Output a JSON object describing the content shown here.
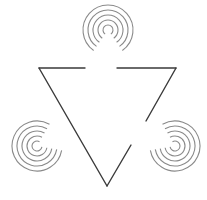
{
  "diagram": {
    "type": "illusory-contour-triangle",
    "background": "#ffffff",
    "line_color": "#3a3a3a",
    "arc_color": "#8a8a8a",
    "triangle": {
      "vertices": [
        [
          39,
          68
        ],
        [
          176,
          68
        ],
        [
          107,
          186
        ]
      ],
      "segments": [
        {
          "x1": 39,
          "y1": 68,
          "x2": 85,
          "y2": 68
        },
        {
          "x1": 117,
          "y1": 68,
          "x2": 176,
          "y2": 68
        },
        {
          "x1": 176,
          "y1": 68,
          "x2": 146,
          "y2": 121
        },
        {
          "x1": 131,
          "y1": 145,
          "x2": 107,
          "y2": 186
        },
        {
          "x1": 107,
          "y1": 186,
          "x2": 39,
          "y2": 68
        }
      ]
    },
    "spirals": [
      {
        "name": "top",
        "cx": 108,
        "cy": 30,
        "radii": [
          5,
          10,
          15,
          20,
          25
        ],
        "gap_start_deg": 55,
        "gap_end_deg": 125
      },
      {
        "name": "left",
        "cx": 37,
        "cy": 146,
        "radii": [
          5,
          10,
          15,
          20,
          25
        ],
        "gap_start_deg": -60,
        "gap_end_deg": 10
      },
      {
        "name": "right",
        "cx": 175,
        "cy": 146,
        "radii": [
          5,
          10,
          15,
          20,
          25
        ],
        "gap_start_deg": 170,
        "gap_end_deg": 240
      }
    ]
  }
}
